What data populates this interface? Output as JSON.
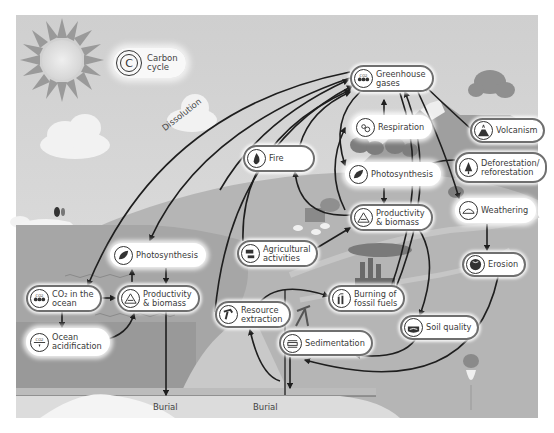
{
  "title": {
    "line1": "Carbon",
    "line2": "cycle",
    "icon": "carbon-cycle-icon",
    "glyph": "C"
  },
  "nodes": {
    "greenhouse_gases": {
      "line1": "Greenhouse",
      "line2": "gases",
      "icon": "co2-molecule-icon"
    },
    "respiration": {
      "line1": "Respiration",
      "line2": "",
      "icon": "respiration-icon"
    },
    "fire": {
      "line1": "Fire",
      "line2": "",
      "icon": "fire-icon"
    },
    "volcanism": {
      "line1": "Volcanism",
      "line2": "",
      "icon": "volcano-icon"
    },
    "photosynthesis_land": {
      "line1": "Photosynthesis",
      "line2": "",
      "icon": "leaf-icon"
    },
    "deforestation": {
      "line1": "Deforestation/",
      "line2": "reforestation",
      "icon": "tree-icon"
    },
    "productivity_land": {
      "line1": "Productivity",
      "line2": "& biomass",
      "icon": "biomass-pyramid-icon"
    },
    "weathering": {
      "line1": "Weathering",
      "line2": "",
      "icon": "rock-weathering-icon"
    },
    "agricultural": {
      "line1": "Agricultural",
      "line2": "activities",
      "icon": "farm-icon"
    },
    "photosynthesis_ocean": {
      "line1": "Photosynthesis",
      "line2": "",
      "icon": "leaf-icon"
    },
    "co2_ocean": {
      "line1": "CO₂ in the",
      "line2": "ocean",
      "icon": "co2-molecule-icon"
    },
    "productivity_ocean": {
      "line1": "Productivity",
      "line2": "& biomass",
      "icon": "biomass-pyramid-icon"
    },
    "erosion": {
      "line1": "Erosion",
      "line2": "",
      "icon": "globe-icon"
    },
    "resource_extraction": {
      "line1": "Resource",
      "line2": "extraction",
      "icon": "oil-pump-icon"
    },
    "burning_fossil": {
      "line1": "Burning of",
      "line2": "fossil fuels",
      "icon": "smokestack-icon"
    },
    "ocean_acidification": {
      "line1": "Ocean",
      "line2": "acidification",
      "icon": "ocean-co2-icon"
    },
    "soil_quality": {
      "line1": "Soil quality",
      "line2": "",
      "icon": "soil-icon"
    },
    "sedimentation": {
      "line1": "Sedimentation",
      "line2": "",
      "icon": "sediment-layers-icon"
    }
  },
  "labels": {
    "dissolution": "Dissolution",
    "burial_1": "Burial",
    "burial_2": "Burial"
  },
  "colors": {
    "sky": "#d4d4d4",
    "ocean": "#a9a9a9",
    "deep_ocean": "#9a9a9a",
    "land": "#b8b8b8",
    "arrow": "#1e1e1e",
    "node_border": "#6f6f6f"
  }
}
